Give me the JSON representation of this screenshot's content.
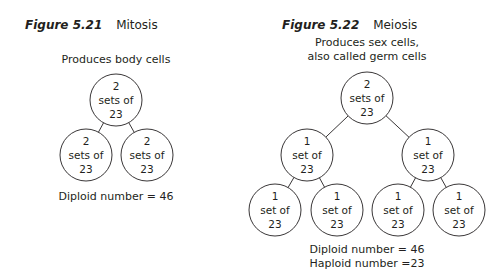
{
  "figures": [
    {
      "number": "Figure 5.21",
      "name": "Mitosis",
      "subtitle": [
        "Produces body cells"
      ],
      "footer": [
        "Diploid number = 46"
      ],
      "cells": [
        {
          "id": "m-top",
          "lines": [
            "2",
            "sets of",
            "23"
          ],
          "cx": 116,
          "cy": 100
        },
        {
          "id": "m-left",
          "lines": [
            "2",
            "sets of",
            "23"
          ],
          "cx": 86,
          "cy": 155
        },
        {
          "id": "m-right",
          "lines": [
            "2",
            "sets of",
            "23"
          ],
          "cx": 147,
          "cy": 155
        }
      ],
      "edges": [
        [
          "m-top",
          "m-left"
        ],
        [
          "m-top",
          "m-right"
        ]
      ]
    },
    {
      "number": "Figure 5.22",
      "name": "Meiosis",
      "subtitle": [
        "Produces sex cells,",
        "also called germ cells"
      ],
      "footer": [
        "Diploid number = 46",
        "Haploid number =23"
      ],
      "cells": [
        {
          "id": "e-top",
          "lines": [
            "2",
            "sets of",
            "23"
          ],
          "cx": 367,
          "cy": 98
        },
        {
          "id": "e-ml",
          "lines": [
            "1",
            "set of",
            "23"
          ],
          "cx": 307,
          "cy": 155
        },
        {
          "id": "e-mr",
          "lines": [
            "1",
            "set of",
            "23"
          ],
          "cx": 428,
          "cy": 155
        },
        {
          "id": "e-b1",
          "lines": [
            "1",
            "set of",
            "23"
          ],
          "cx": 275,
          "cy": 210
        },
        {
          "id": "e-b2",
          "lines": [
            "1",
            "set of",
            "23"
          ],
          "cx": 337,
          "cy": 210
        },
        {
          "id": "e-b3",
          "lines": [
            "1",
            "set of",
            "23"
          ],
          "cx": 398,
          "cy": 210
        },
        {
          "id": "e-b4",
          "lines": [
            "1",
            "set of",
            "23"
          ],
          "cx": 459,
          "cy": 210
        }
      ],
      "edges": [
        [
          "e-top",
          "e-ml"
        ],
        [
          "e-top",
          "e-mr"
        ],
        [
          "e-ml",
          "e-b1"
        ],
        [
          "e-ml",
          "e-b2"
        ],
        [
          "e-mr",
          "e-b3"
        ],
        [
          "e-mr",
          "e-b4"
        ]
      ]
    }
  ],
  "style": {
    "stroke": "#231f20",
    "radius": 26
  }
}
